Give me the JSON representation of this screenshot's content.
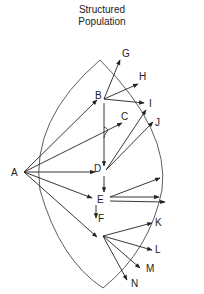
{
  "title": {
    "line1": "Structured",
    "line2": "Population"
  },
  "nodes": {
    "A": "A",
    "B": "B",
    "C": "C",
    "D": "D",
    "E": "E",
    "F": "F",
    "G": "G",
    "H": "H",
    "I": "I",
    "J": "J",
    "K": "K",
    "L": "L",
    "M": "M",
    "N": "N"
  },
  "colors": {
    "stroke": "#222222",
    "background": "#ffffff"
  }
}
